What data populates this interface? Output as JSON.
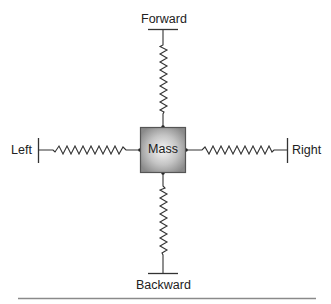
{
  "diagram": {
    "mass": {
      "label": "Mass",
      "fill_center": "#f4f4f4",
      "fill_edge": "#8c8c8c",
      "border": "#555555"
    },
    "directions": {
      "forward": "Forward",
      "backward": "Backward",
      "left": "Left",
      "right": "Right"
    },
    "springs": [
      {
        "name": "forward-spring",
        "connects": [
          "Mass",
          "Forward"
        ]
      },
      {
        "name": "backward-spring",
        "connects": [
          "Mass",
          "Backward"
        ]
      },
      {
        "name": "left-spring",
        "connects": [
          "Mass",
          "Left"
        ]
      },
      {
        "name": "right-spring",
        "connects": [
          "Mass",
          "Right"
        ]
      }
    ],
    "line_color": "#333333",
    "rule_color": "#888888"
  }
}
